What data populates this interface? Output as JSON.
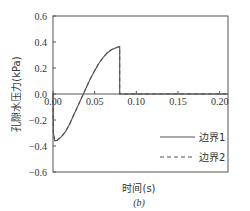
{
  "chart_data": {
    "type": "line",
    "title": "",
    "subtitle": "(b)",
    "xlabel": "时间(s)",
    "ylabel": "孔隙水压力(kPa)",
    "xlim": [
      0,
      0.21
    ],
    "ylim": [
      -0.6,
      0.6
    ],
    "x_ticks": [
      0.0,
      0.05,
      0.1,
      0.15,
      0.2
    ],
    "x_tick_labels": [
      "0.00",
      "0.05",
      "0.10",
      "0.15",
      "0.20"
    ],
    "y_ticks": [
      0.6,
      0.4,
      0.2,
      0.0,
      -0.2,
      -0.4,
      -0.6
    ],
    "y_tick_labels": [
      "0.6",
      "0.4",
      "0.2",
      "0.0",
      "−0.2",
      "−0.4",
      "−0.6"
    ],
    "grid": false,
    "legend_position": "lower right",
    "series": [
      {
        "name": "边界1",
        "style": "solid",
        "x": [
          0.0,
          0.0005,
          0.002,
          0.005,
          0.01,
          0.015,
          0.02,
          0.025,
          0.03,
          0.035,
          0.04,
          0.045,
          0.05,
          0.055,
          0.06,
          0.065,
          0.07,
          0.075,
          0.08,
          0.08,
          0.09,
          0.1,
          0.12,
          0.14,
          0.16,
          0.18,
          0.2,
          0.21
        ],
        "values": [
          0.0,
          -0.3,
          -0.36,
          -0.355,
          -0.33,
          -0.29,
          -0.23,
          -0.16,
          -0.09,
          -0.02,
          0.05,
          0.12,
          0.18,
          0.235,
          0.28,
          0.315,
          0.34,
          0.355,
          0.365,
          0.0,
          0.0,
          0.0,
          0.0,
          0.0,
          0.0,
          0.0,
          0.0,
          0.0
        ]
      },
      {
        "name": "边界2",
        "style": "dashed",
        "x": [
          0.0,
          0.0005,
          0.002,
          0.005,
          0.01,
          0.015,
          0.02,
          0.025,
          0.03,
          0.035,
          0.04,
          0.045,
          0.05,
          0.055,
          0.06,
          0.065,
          0.07,
          0.075,
          0.08,
          0.08,
          0.09,
          0.1,
          0.12,
          0.14,
          0.16,
          0.18,
          0.2,
          0.21
        ],
        "values": [
          0.0,
          -0.3,
          -0.36,
          -0.355,
          -0.33,
          -0.29,
          -0.23,
          -0.16,
          -0.09,
          -0.02,
          0.05,
          0.12,
          0.18,
          0.235,
          0.28,
          0.315,
          0.34,
          0.355,
          0.365,
          0.0,
          0.0,
          0.0,
          0.0,
          0.0,
          0.0,
          0.0,
          0.0,
          0.0
        ]
      }
    ]
  },
  "colors": {
    "axis": "#555555",
    "series_1": "#555555",
    "series_2": "#555555"
  }
}
